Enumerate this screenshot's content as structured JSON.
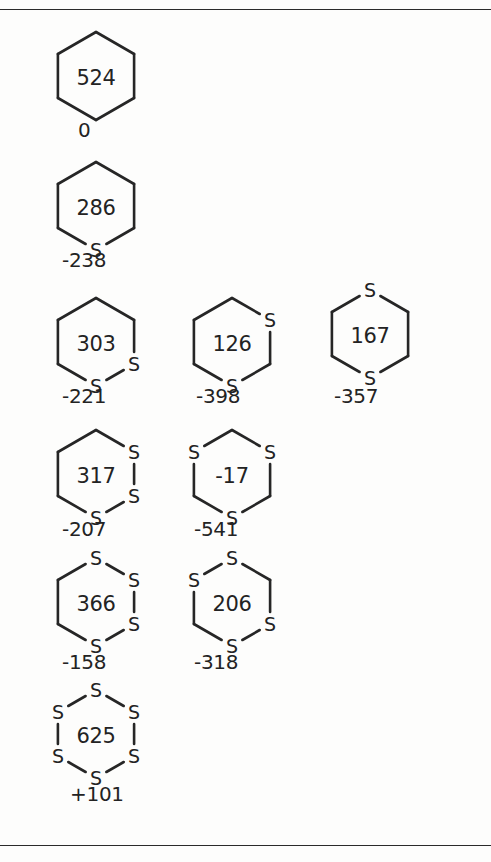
{
  "page": {
    "background_color": "#fdfdfc",
    "ink_color": "#232323",
    "rules": [
      {
        "name": "top-rule",
        "y": 9
      },
      {
        "name": "bottom-rule",
        "y": 845
      }
    ]
  },
  "diagram": {
    "type": "chemical-structure-grid",
    "ring_size": 6,
    "ring_orientation": "pointy-top",
    "vertex_order": [
      "top",
      "top-right",
      "bottom-right",
      "bottom",
      "bottom-left",
      "top-left"
    ],
    "structures": [
      {
        "id": "s1",
        "center_value": "524",
        "energy_value": "0",
        "sulfur_count": 0,
        "sulfur_vertices": [],
        "x": 52,
        "y": 30,
        "label_x": 78,
        "label_y": 118
      },
      {
        "id": "s2",
        "center_value": "286",
        "energy_value": "-238",
        "sulfur_count": 1,
        "sulfur_vertices": [
          "bottom"
        ],
        "x": 52,
        "y": 160,
        "label_x": 62,
        "label_y": 248
      },
      {
        "id": "s3",
        "center_value": "303",
        "energy_value": "-221",
        "sulfur_count": 2,
        "sulfur_vertices": [
          "bottom-right",
          "bottom"
        ],
        "x": 52,
        "y": 296,
        "label_x": 62,
        "label_y": 384
      },
      {
        "id": "s4",
        "center_value": "126",
        "energy_value": "-398",
        "sulfur_count": 2,
        "sulfur_vertices": [
          "top-right",
          "bottom"
        ],
        "x": 188,
        "y": 296,
        "label_x": 196,
        "label_y": 384
      },
      {
        "id": "s5",
        "center_value": "167",
        "energy_value": "-357",
        "sulfur_count": 2,
        "sulfur_vertices": [
          "top",
          "bottom"
        ],
        "x": 326,
        "y": 288,
        "label_x": 334,
        "label_y": 384
      },
      {
        "id": "s6",
        "center_value": "317",
        "energy_value": "-207",
        "sulfur_count": 3,
        "sulfur_vertices": [
          "top-right",
          "bottom-right",
          "bottom"
        ],
        "x": 52,
        "y": 428,
        "label_x": 62,
        "label_y": 517
      },
      {
        "id": "s7",
        "center_value": "-17",
        "energy_value": "-541",
        "sulfur_count": 3,
        "sulfur_vertices": [
          "top-left",
          "top-right",
          "bottom"
        ],
        "x": 188,
        "y": 428,
        "label_x": 194,
        "label_y": 517
      },
      {
        "id": "s8",
        "center_value": "366",
        "energy_value": "-158",
        "sulfur_count": 4,
        "sulfur_vertices": [
          "top",
          "top-right",
          "bottom-right",
          "bottom"
        ],
        "x": 52,
        "y": 556,
        "label_x": 62,
        "label_y": 650
      },
      {
        "id": "s9",
        "center_value": "206",
        "energy_value": "-318",
        "sulfur_count": 4,
        "sulfur_vertices": [
          "top",
          "top-left",
          "bottom-right",
          "bottom"
        ],
        "x": 188,
        "y": 556,
        "label_x": 194,
        "label_y": 650
      },
      {
        "id": "s10",
        "center_value": "625",
        "energy_value": "+101",
        "sulfur_count": 6,
        "sulfur_vertices": [
          "top",
          "top-right",
          "bottom-right",
          "bottom",
          "bottom-left",
          "top-left"
        ],
        "x": 52,
        "y": 688,
        "label_x": 70,
        "label_y": 782
      }
    ],
    "sulfur_symbol": "S"
  }
}
